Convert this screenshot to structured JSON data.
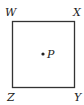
{
  "diagram": {
    "shape": "square",
    "vertices": {
      "top_left": "W",
      "top_right": "X",
      "bottom_right": "Y",
      "bottom_left": "Z"
    },
    "interior_point": "P",
    "colors": {
      "stroke": "#333333",
      "background": "#ffffff"
    }
  }
}
